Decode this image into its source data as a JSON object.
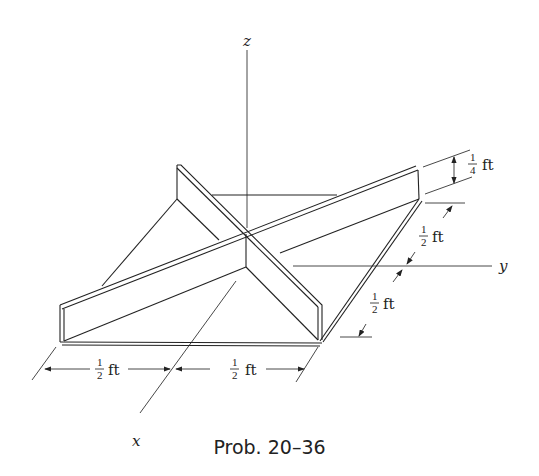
{
  "axes": {
    "x_label": "x",
    "y_label": "y",
    "z_label": "z"
  },
  "dimensions": {
    "height": {
      "num": "1",
      "den": "4",
      "unit": "ft"
    },
    "side_upper": {
      "num": "1",
      "den": "2",
      "unit": "ft"
    },
    "side_lower": {
      "num": "1",
      "den": "2",
      "unit": "ft"
    },
    "bottom_left": {
      "num": "1",
      "den": "2",
      "unit": "ft"
    },
    "bottom_right": {
      "num": "1",
      "den": "2",
      "unit": "ft"
    }
  },
  "caption": "Prob. 20–36",
  "colors": {
    "ink": "#222222",
    "background": "#ffffff"
  }
}
